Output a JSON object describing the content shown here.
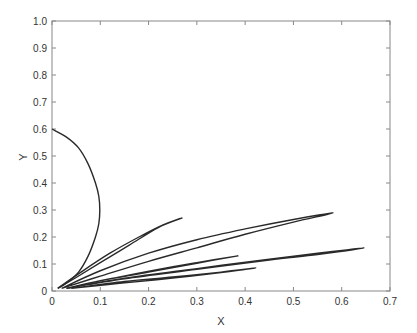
{
  "chart_data": {
    "type": "line",
    "title": "",
    "xlabel": "X",
    "ylabel": "Y",
    "xlim": [
      0,
      0.7
    ],
    "ylim": [
      0,
      1.0
    ],
    "grid": false,
    "legend": null,
    "x_ticks": [
      "0",
      "0.1",
      "0.2",
      "0.3",
      "0.4",
      "0.5",
      "0.6",
      "0.7"
    ],
    "y_ticks": [
      "0",
      "0.1",
      "0.2",
      "0.3",
      "0.4",
      "0.5",
      "0.6",
      "0.7",
      "0.8",
      "0.9",
      "1.0"
    ],
    "line_color": "#2a2a2a",
    "series": [
      {
        "name": "semicircle",
        "x": [
          0.0,
          0.03,
          0.055,
          0.075,
          0.09,
          0.097,
          0.099,
          0.097,
          0.09,
          0.075,
          0.055,
          0.03,
          0.012
        ],
        "y": [
          0.6,
          0.57,
          0.53,
          0.47,
          0.4,
          0.35,
          0.3,
          0.25,
          0.2,
          0.13,
          0.07,
          0.03,
          0.01
        ]
      },
      {
        "name": "loop-0.27",
        "x": [
          0.012,
          0.06,
          0.12,
          0.18,
          0.23,
          0.269,
          0.22,
          0.16,
          0.1,
          0.05,
          0.012
        ],
        "y": [
          0.01,
          0.07,
          0.14,
          0.2,
          0.245,
          0.27,
          0.235,
          0.17,
          0.105,
          0.05,
          0.01
        ]
      },
      {
        "name": "loop-0.58",
        "x": [
          0.02,
          0.1,
          0.2,
          0.3,
          0.4,
          0.5,
          0.582,
          0.5,
          0.4,
          0.3,
          0.2,
          0.1,
          0.02
        ],
        "y": [
          0.01,
          0.075,
          0.14,
          0.19,
          0.23,
          0.265,
          0.289,
          0.255,
          0.21,
          0.16,
          0.11,
          0.055,
          0.01
        ]
      },
      {
        "name": "loop-0.64",
        "x": [
          0.03,
          0.15,
          0.3,
          0.45,
          0.55,
          0.646,
          0.55,
          0.45,
          0.3,
          0.15,
          0.03
        ],
        "y": [
          0.01,
          0.045,
          0.08,
          0.115,
          0.135,
          0.159,
          0.14,
          0.118,
          0.083,
          0.047,
          0.01
        ]
      },
      {
        "name": "curve-0.385",
        "x": [
          0.03,
          0.12,
          0.22,
          0.3,
          0.385,
          0.3,
          0.2,
          0.1,
          0.03
        ],
        "y": [
          0.01,
          0.045,
          0.08,
          0.105,
          0.13,
          0.103,
          0.07,
          0.038,
          0.01
        ]
      },
      {
        "name": "curve-0.42",
        "x": [
          0.04,
          0.15,
          0.25,
          0.35,
          0.422,
          0.35,
          0.25,
          0.15,
          0.04
        ],
        "y": [
          0.01,
          0.035,
          0.052,
          0.07,
          0.085,
          0.068,
          0.048,
          0.03,
          0.01
        ]
      }
    ]
  }
}
